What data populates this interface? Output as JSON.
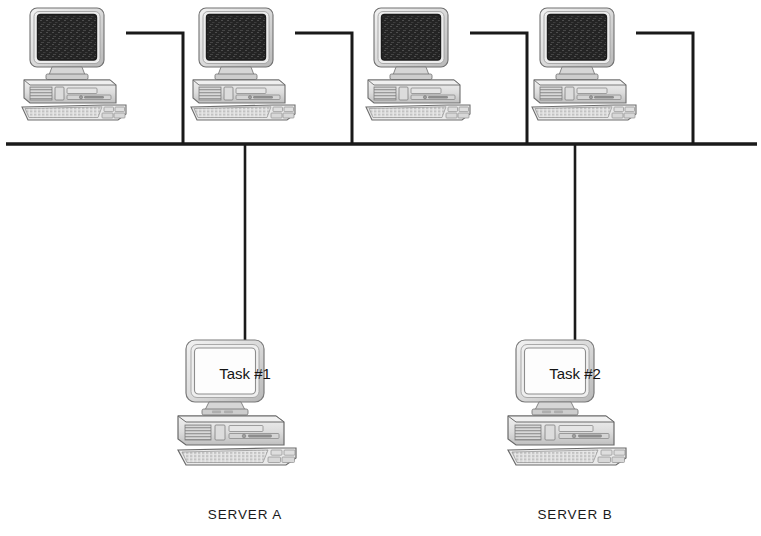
{
  "diagram": {
    "type": "network-topology",
    "background_color": "#ffffff",
    "line_color": "#1a1a1a",
    "bus": {
      "name": "network-bus-line",
      "y": 144,
      "x_start": 6,
      "x_end": 757,
      "thickness": 3.2
    },
    "workstations": [
      {
        "id": "workstation-1",
        "name": "workstation-1",
        "screen_label": "",
        "screen_style": "dark",
        "center_x": 85,
        "top_y": 8,
        "cable_exit_x": 126,
        "cable_exit_y": 33,
        "drop_x": 183
      },
      {
        "id": "workstation-2",
        "name": "workstation-2",
        "screen_label": "",
        "screen_style": "dark",
        "center_x": 254,
        "top_y": 8,
        "cable_exit_x": 295,
        "cable_exit_y": 33,
        "drop_x": 352
      },
      {
        "id": "workstation-3",
        "name": "workstation-3",
        "screen_label": "",
        "screen_style": "dark",
        "center_x": 429,
        "top_y": 8,
        "cable_exit_x": 470,
        "cable_exit_y": 33,
        "drop_x": 527
      },
      {
        "id": "workstation-4",
        "name": "workstation-4",
        "screen_label": "",
        "screen_style": "dark",
        "center_x": 595,
        "top_y": 8,
        "cable_exit_x": 636,
        "cable_exit_y": 33,
        "drop_x": 693
      }
    ],
    "servers": [
      {
        "id": "server-a",
        "name": "server-a",
        "label": "SERVER A",
        "screen_label": "Task #1",
        "screen_style": "light",
        "center_x": 245,
        "top_y": 340,
        "drop_x": 245,
        "label_y": 519
      },
      {
        "id": "server-b",
        "name": "server-b",
        "label": "SERVER B",
        "screen_label": "Task #2",
        "screen_style": "light",
        "center_x": 575,
        "top_y": 340,
        "drop_x": 575,
        "label_y": 519
      }
    ],
    "colors": {
      "cable": "#1a1a1a",
      "screen_dark": "#2a2a2a",
      "screen_light": "#fdfdfd",
      "case_light": "#e8e8e8",
      "case_mid": "#d2d2d2",
      "case_dark": "#b4b4b4",
      "outline": "#6e6e6e",
      "outline_strong": "#4a4a4a",
      "text": "#1a1a1a"
    }
  }
}
